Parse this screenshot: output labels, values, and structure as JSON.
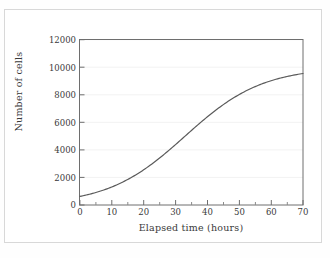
{
  "chart_data": {
    "type": "line",
    "title": "",
    "xlabel": "Elapsed time (hours)",
    "ylabel": "Number of cells",
    "xlim": [
      0,
      70
    ],
    "ylim": [
      0,
      12000
    ],
    "xticks": [
      0,
      10,
      20,
      30,
      40,
      50,
      60,
      70
    ],
    "xtick_labels": [
      "0",
      "10",
      "20",
      "30",
      "40",
      "50",
      "60",
      "70"
    ],
    "x_minor_tick_interval": 5,
    "yticks": [
      0,
      2000,
      4000,
      6000,
      8000,
      10000,
      12000
    ],
    "ytick_labels": [
      "0",
      "2000",
      "4000",
      "6000",
      "8000",
      "10000",
      "12000"
    ],
    "grid": "horizontal-faint",
    "legend": "none",
    "series": [
      {
        "name": "Number of cells",
        "color": "#5a5a5a",
        "x": [
          0,
          2,
          4,
          6,
          8,
          10,
          12,
          14,
          16,
          18,
          20,
          22,
          24,
          26,
          28,
          30,
          32,
          34,
          36,
          38,
          40,
          42,
          44,
          46,
          48,
          50,
          52,
          54,
          56,
          58,
          60,
          62,
          64,
          66,
          68,
          70
        ],
        "values": [
          620,
          700,
          790,
          893,
          1008,
          1138,
          1284,
          1447,
          1628,
          1830,
          2052,
          2296,
          2562,
          2851,
          3161,
          3492,
          3842,
          4207,
          4585,
          4970,
          5357,
          5741,
          6116,
          6477,
          6819,
          7139,
          7434,
          7703,
          7946,
          8163,
          8354,
          8522,
          8667,
          8792,
          8900,
          8991
        ]
      }
    ],
    "curve_model": {
      "form": "logistic",
      "carrying_capacity": 10000,
      "initial_value": 620,
      "growth_rate": 0.12,
      "inflection_hours": 33
    }
  },
  "colors": {
    "frame": "#6e6e6e",
    "curve": "#5a5a5a",
    "text": "#3a3a3a",
    "grid": "#f2f2f2",
    "outer_border": "#d8d8d8",
    "background": "#ffffff"
  }
}
